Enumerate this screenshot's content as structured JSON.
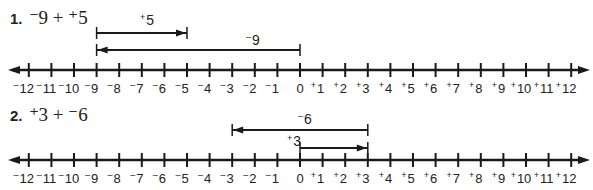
{
  "problems": [
    {
      "number": "1.",
      "expression": "⁻9 + ⁺5",
      "addends": [
        -9,
        5
      ],
      "vectors": [
        {
          "label": "+5",
          "from": -9,
          "to": -5,
          "row": 1,
          "direction": "right"
        },
        {
          "label": "-9",
          "from": 0,
          "to": -9,
          "row": 2,
          "direction": "left"
        }
      ]
    },
    {
      "number": "2.",
      "expression": "⁺3 + ⁻6",
      "addends": [
        3,
        -6
      ],
      "vectors": [
        {
          "label": "-6",
          "from": 3,
          "to": -3,
          "row": 1,
          "direction": "left"
        },
        {
          "label": "+3",
          "from": 0,
          "to": 3,
          "row": 2,
          "direction": "right"
        }
      ]
    }
  ],
  "number_line": {
    "min": -12,
    "max": 12,
    "step": 1,
    "arrows_both_ends": true,
    "tick_labels": [
      "-12",
      "-11",
      "-10",
      "-9",
      "-8",
      "-7",
      "-6",
      "-5",
      "-4",
      "-3",
      "-2",
      "-1",
      "0",
      "+1",
      "+2",
      "+3",
      "+4",
      "+5",
      "+6",
      "+7",
      "+8",
      "+9",
      "+10",
      "+11",
      "+12"
    ]
  },
  "colors": {
    "ink": "#1a1a1a",
    "background": "#ffffff"
  }
}
